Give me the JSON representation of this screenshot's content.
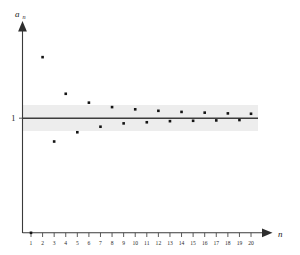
{
  "chart_data": {
    "type": "scatter",
    "title": "",
    "subtitle": "",
    "xlabel": "n",
    "ylabel": "a_n",
    "x": [
      1,
      2,
      3,
      4,
      5,
      6,
      7,
      8,
      9,
      10,
      11,
      12,
      13,
      14,
      15,
      16,
      17,
      18,
      19,
      20
    ],
    "values": [
      0.0,
      2.65,
      0.37,
      1.66,
      0.62,
      1.42,
      0.77,
      1.3,
      0.86,
      1.24,
      0.89,
      1.2,
      0.92,
      1.17,
      0.93,
      1.15,
      0.94,
      1.13,
      0.95,
      1.12
    ],
    "categories": [
      "1",
      "2",
      "3",
      "4",
      "5",
      "6",
      "7",
      "8",
      "9",
      "10",
      "11",
      "12",
      "13",
      "14",
      "15",
      "16",
      "17",
      "18",
      "19",
      "20"
    ],
    "xlim": [
      0,
      21
    ],
    "ylim": [
      0.0,
      3.1
    ],
    "grid": false,
    "legend": "none",
    "marker": "square",
    "marker_color": "#141414",
    "annotations": [
      {
        "name": "limit-line",
        "type": "horizontal-line",
        "y": 1.0,
        "label": "1",
        "color": "#3d3d3d"
      },
      {
        "name": "epsilon-band",
        "type": "horizontal-band",
        "y_low": 0.82,
        "y_high": 1.18,
        "color": "#ededed"
      }
    ]
  },
  "axes": {
    "y_axis_label": "a",
    "y_axis_label_sub": "n",
    "x_axis_label": "n",
    "y_tick_label": "1",
    "x_tick_labels": [
      "1",
      "2",
      "3",
      "4",
      "5",
      "6",
      "7",
      "8",
      "9",
      "10",
      "11",
      "12",
      "13",
      "14",
      "15",
      "16",
      "17",
      "18",
      "19",
      "20"
    ]
  },
  "colors": {
    "axis": "#3a3a3a",
    "point": "#141414",
    "band": "#ededed",
    "limit_line": "#3d3d3d",
    "background": "#ffffff"
  }
}
